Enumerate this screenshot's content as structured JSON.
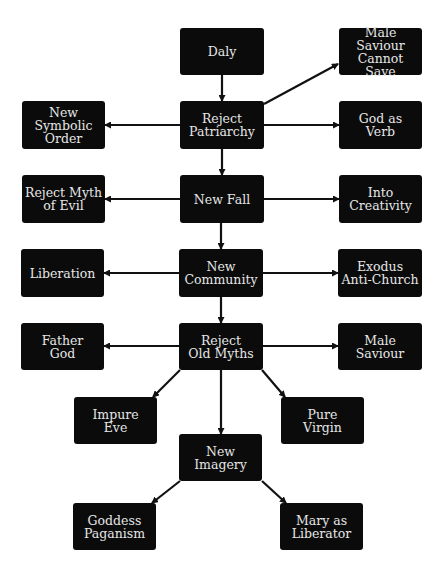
{
  "diagram": {
    "colors": {
      "background": "#ffffff",
      "node_fill": "#0b0b0b",
      "node_text": "#e6e6e6",
      "edge": "#111111"
    },
    "nodes": [
      {
        "id": "daly",
        "label": "Daly",
        "x": 180,
        "y": 28,
        "w": 84,
        "h": 47
      },
      {
        "id": "male_saviour_cannot_save",
        "label": "Male Saviour\nCannot Save",
        "x": 339,
        "y": 28,
        "w": 83,
        "h": 47
      },
      {
        "id": "reject_patriarchy",
        "label": "Reject\nPatriarchy",
        "x": 180,
        "y": 101,
        "w": 84,
        "h": 48
      },
      {
        "id": "new_symbolic_order",
        "label": "New\nSymbolic\nOrder",
        "x": 22,
        "y": 101,
        "w": 83,
        "h": 48
      },
      {
        "id": "god_as_verb",
        "label": "God as\nVerb",
        "x": 339,
        "y": 101,
        "w": 83,
        "h": 48
      },
      {
        "id": "new_fall",
        "label": "New Fall",
        "x": 180,
        "y": 175,
        "w": 84,
        "h": 48
      },
      {
        "id": "reject_myth_of_evil",
        "label": "Reject Myth\nof Evil",
        "x": 22,
        "y": 175,
        "w": 83,
        "h": 48
      },
      {
        "id": "into_creativity",
        "label": "Into\nCreativity",
        "x": 339,
        "y": 175,
        "w": 83,
        "h": 48
      },
      {
        "id": "new_community",
        "label": "New\nCommunity",
        "x": 179,
        "y": 249,
        "w": 84,
        "h": 48
      },
      {
        "id": "liberation",
        "label": "Liberation",
        "x": 21,
        "y": 249,
        "w": 83,
        "h": 48
      },
      {
        "id": "exodus_anti_church",
        "label": "Exodus\nAnti-Church",
        "x": 338,
        "y": 249,
        "w": 84,
        "h": 48
      },
      {
        "id": "reject_old_myths",
        "label": "Reject\nOld Myths",
        "x": 179,
        "y": 323,
        "w": 84,
        "h": 47
      },
      {
        "id": "father_god",
        "label": "Father\nGod",
        "x": 21,
        "y": 323,
        "w": 83,
        "h": 47
      },
      {
        "id": "male_saviour",
        "label": "Male\nSaviour",
        "x": 338,
        "y": 323,
        "w": 84,
        "h": 47
      },
      {
        "id": "impure_eve",
        "label": "Impure\nEve",
        "x": 74,
        "y": 397,
        "w": 83,
        "h": 47
      },
      {
        "id": "pure_virgin",
        "label": "Pure\nVirgin",
        "x": 281,
        "y": 397,
        "w": 83,
        "h": 47
      },
      {
        "id": "new_imagery",
        "label": "New\nImagery",
        "x": 179,
        "y": 434,
        "w": 83,
        "h": 47
      },
      {
        "id": "goddess_paganism",
        "label": "Goddess\nPaganism",
        "x": 73,
        "y": 503,
        "w": 83,
        "h": 47
      },
      {
        "id": "mary_as_liberator",
        "label": "Mary as\nLiberator",
        "x": 280,
        "y": 503,
        "w": 83,
        "h": 47
      }
    ],
    "edges": [
      {
        "from": "daly",
        "to": "reject_patriarchy",
        "x1": 222,
        "y1": 75,
        "x2": 222,
        "y2": 101
      },
      {
        "from": "reject_patriarchy",
        "to": "male_saviour_cannot_save",
        "x1": 264,
        "y1": 104,
        "x2": 338,
        "y2": 64
      },
      {
        "from": "reject_patriarchy",
        "to": "new_symbolic_order",
        "x1": 180,
        "y1": 125,
        "x2": 105,
        "y2": 125
      },
      {
        "from": "reject_patriarchy",
        "to": "god_as_verb",
        "x1": 264,
        "y1": 125,
        "x2": 339,
        "y2": 125
      },
      {
        "from": "reject_patriarchy",
        "to": "new_fall",
        "x1": 222,
        "y1": 149,
        "x2": 222,
        "y2": 175
      },
      {
        "from": "new_fall",
        "to": "reject_myth_of_evil",
        "x1": 180,
        "y1": 199,
        "x2": 105,
        "y2": 199
      },
      {
        "from": "new_fall",
        "to": "into_creativity",
        "x1": 264,
        "y1": 199,
        "x2": 339,
        "y2": 199
      },
      {
        "from": "new_fall",
        "to": "new_community",
        "x1": 221,
        "y1": 223,
        "x2": 221,
        "y2": 249
      },
      {
        "from": "new_community",
        "to": "liberation",
        "x1": 179,
        "y1": 273,
        "x2": 104,
        "y2": 273
      },
      {
        "from": "new_community",
        "to": "exodus_anti_church",
        "x1": 263,
        "y1": 273,
        "x2": 338,
        "y2": 273
      },
      {
        "from": "new_community",
        "to": "reject_old_myths",
        "x1": 221,
        "y1": 297,
        "x2": 221,
        "y2": 323
      },
      {
        "from": "reject_old_myths",
        "to": "father_god",
        "x1": 179,
        "y1": 346,
        "x2": 104,
        "y2": 346
      },
      {
        "from": "reject_old_myths",
        "to": "male_saviour",
        "x1": 263,
        "y1": 346,
        "x2": 338,
        "y2": 346
      },
      {
        "from": "reject_old_myths",
        "to": "impure_eve",
        "x1": 180,
        "y1": 370,
        "x2": 153,
        "y2": 397
      },
      {
        "from": "reject_old_myths",
        "to": "pure_virgin",
        "x1": 262,
        "y1": 370,
        "x2": 285,
        "y2": 397
      },
      {
        "from": "reject_old_myths",
        "to": "new_imagery",
        "x1": 221,
        "y1": 370,
        "x2": 221,
        "y2": 434
      },
      {
        "from": "new_imagery",
        "to": "goddess_paganism",
        "x1": 180,
        "y1": 481,
        "x2": 152,
        "y2": 503
      },
      {
        "from": "new_imagery",
        "to": "mary_as_liberator",
        "x1": 262,
        "y1": 481,
        "x2": 286,
        "y2": 503
      }
    ]
  }
}
